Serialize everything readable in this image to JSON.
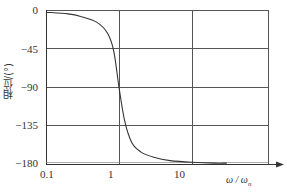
{
  "chart_data": {
    "type": "line",
    "title": "",
    "xlabel": "ω / ωn",
    "ylabel": "相位/(°)",
    "xscale": "log",
    "xlim": [
      0.1,
      30
    ],
    "ylim": [
      -180,
      0
    ],
    "x_ticks": [
      "0.1",
      "1",
      "10"
    ],
    "y_ticks": [
      "0",
      "-45",
      "-90",
      "-135",
      "-180"
    ],
    "grid": true,
    "legend": null,
    "series": [
      {
        "name": "phase",
        "x": [
          0.1,
          0.2,
          0.3,
          0.5,
          0.7,
          0.85,
          1.0,
          1.2,
          1.5,
          2.0,
          3.0,
          5.0,
          10.0,
          20.0,
          30.0
        ],
        "values": [
          -2,
          -4,
          -7,
          -14,
          -27,
          -48,
          -90,
          -130,
          -155,
          -166,
          -172,
          -176,
          -178,
          -179,
          -179
        ]
      }
    ]
  },
  "labels": {
    "y_ticks": [
      "0",
      "−45",
      "−90",
      "−135",
      "−180"
    ],
    "x_ticks": [
      "0.1",
      "1",
      "10"
    ],
    "ylabel": "相位/(°)",
    "xlabel_main": "ω / ω",
    "xlabel_sub": "n"
  }
}
